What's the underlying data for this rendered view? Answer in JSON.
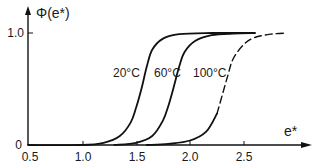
{
  "chart_data": {
    "type": "line",
    "title": "",
    "xlabel": "e*",
    "ylabel": "Φ(e*)",
    "xlim": [
      0.5,
      2.95
    ],
    "ylim": [
      0,
      1.05
    ],
    "xticks": [
      "0.5",
      "1.0",
      "1.5",
      "2.0",
      "2.5"
    ],
    "yticks": [
      "0",
      "1.0"
    ],
    "grid": false,
    "legend": "inline labels",
    "series": [
      {
        "name": "20°C",
        "style": "solid",
        "x": [
          0.5,
          1.0,
          1.2,
          1.35,
          1.45,
          1.5,
          1.55,
          1.6,
          1.65,
          1.75,
          1.9,
          2.2,
          2.6
        ],
        "y": [
          0.0,
          0.0,
          0.02,
          0.08,
          0.2,
          0.33,
          0.5,
          0.7,
          0.85,
          0.95,
          0.99,
          1.0,
          1.0
        ]
      },
      {
        "name": "60°C",
        "style": "solid",
        "x": [
          1.3,
          1.5,
          1.65,
          1.75,
          1.8,
          1.85,
          1.9,
          1.95,
          2.05,
          2.2,
          2.4,
          2.6
        ],
        "y": [
          0.0,
          0.02,
          0.08,
          0.22,
          0.35,
          0.52,
          0.7,
          0.83,
          0.93,
          0.98,
          0.995,
          1.0
        ]
      },
      {
        "name": "100°C",
        "style": "solid-then-dashed",
        "x": [
          1.6,
          1.8,
          2.0,
          2.15,
          2.25,
          2.3,
          2.35,
          2.4,
          2.5,
          2.6,
          2.75,
          2.9
        ],
        "y": [
          0.0,
          0.01,
          0.04,
          0.12,
          0.28,
          0.45,
          0.62,
          0.77,
          0.9,
          0.96,
          0.99,
          1.0
        ],
        "dashed_from_y": 0.2
      }
    ],
    "annotations": [
      {
        "text": "20°C",
        "x": 1.42,
        "y": 0.53
      },
      {
        "text": "60°C",
        "x": 1.77,
        "y": 0.53
      },
      {
        "text": "100°C",
        "x": 2.13,
        "y": 0.53
      }
    ]
  },
  "labels": {
    "ylabel": "Φ(e*)",
    "xlabel": "e*",
    "ytick_1": "1.0",
    "ytick_0": "0",
    "xticks": [
      "0.5",
      "1.0",
      "1.5",
      "2.0",
      "2.5"
    ],
    "curve_20": "20°C",
    "curve_60": "60°C",
    "curve_100": "100°C"
  }
}
